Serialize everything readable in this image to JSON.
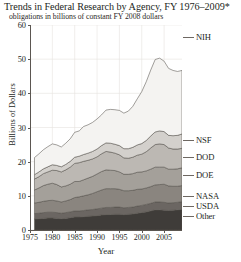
{
  "chart_data": {
    "type": "area",
    "title": "Trends in Federal Research by Agency, FY 1976–2009*",
    "subtitle": "obligations in billions of constant FY 2008 dollars",
    "xlabel": "Year",
    "ylabel": "Billions of Dollars",
    "xlim": [
      1975,
      2009
    ],
    "ylim": [
      0,
      60
    ],
    "yticks": [
      0,
      10,
      20,
      30,
      40,
      50,
      60
    ],
    "xticks": [
      1975,
      1980,
      1985,
      1990,
      1995,
      2000,
      2005
    ],
    "grid": true,
    "stacked": true,
    "legend_position": "right-inline",
    "x": [
      1976,
      1977,
      1978,
      1979,
      1980,
      1981,
      1982,
      1983,
      1984,
      1985,
      1986,
      1987,
      1988,
      1989,
      1990,
      1991,
      1992,
      1993,
      1994,
      1995,
      1996,
      1997,
      1998,
      1999,
      2000,
      2001,
      2002,
      2003,
      2004,
      2005,
      2006,
      2007,
      2008,
      2009
    ],
    "series": [
      {
        "name": "Other",
        "color": "#3f3c39",
        "values": [
          3.2,
          3.3,
          3.4,
          3.5,
          3.5,
          3.4,
          3.3,
          3.4,
          3.6,
          3.8,
          3.8,
          3.9,
          4.0,
          4.1,
          4.2,
          4.4,
          4.5,
          4.5,
          4.6,
          4.6,
          4.5,
          4.6,
          4.7,
          4.9,
          5.1,
          5.3,
          5.6,
          5.9,
          5.9,
          5.8,
          5.7,
          5.8,
          5.9,
          6.0
        ]
      },
      {
        "name": "USDA",
        "color": "#6b6662",
        "values": [
          1.6,
          1.6,
          1.7,
          1.7,
          1.7,
          1.7,
          1.6,
          1.7,
          1.7,
          1.8,
          1.8,
          1.8,
          1.9,
          1.9,
          2.0,
          2.0,
          2.1,
          2.1,
          2.1,
          2.1,
          2.0,
          2.0,
          2.0,
          2.1,
          2.1,
          2.2,
          2.2,
          2.3,
          2.3,
          2.3,
          2.2,
          2.2,
          2.2,
          2.3
        ]
      },
      {
        "name": "NASA",
        "color": "#8a857f",
        "values": [
          3.1,
          3.2,
          3.3,
          3.4,
          3.5,
          3.4,
          3.3,
          3.4,
          3.6,
          3.9,
          4.1,
          4.3,
          4.4,
          4.7,
          5.0,
          5.3,
          5.5,
          5.5,
          5.4,
          5.2,
          5.0,
          4.9,
          4.9,
          4.9,
          4.8,
          4.8,
          4.9,
          5.0,
          5.1,
          5.3,
          5.0,
          4.8,
          4.7,
          4.7
        ]
      },
      {
        "name": "DOE",
        "color": "#a4a09a",
        "values": [
          3.8,
          4.2,
          4.6,
          4.8,
          5.0,
          4.8,
          4.4,
          4.4,
          4.5,
          4.7,
          4.5,
          4.7,
          4.9,
          5.0,
          5.2,
          5.4,
          5.5,
          5.4,
          5.3,
          5.1,
          4.8,
          4.8,
          4.9,
          5.0,
          5.0,
          5.0,
          5.1,
          5.2,
          5.1,
          5.0,
          4.9,
          5.0,
          5.1,
          5.2
        ]
      },
      {
        "name": "DOD",
        "color": "#bcb8b3",
        "values": [
          3.2,
          3.3,
          3.5,
          3.6,
          3.8,
          4.1,
          4.4,
          4.7,
          5.0,
          5.3,
          5.5,
          5.4,
          5.2,
          5.1,
          5.0,
          5.2,
          5.4,
          5.3,
          5.1,
          5.0,
          4.8,
          4.7,
          4.8,
          5.0,
          5.2,
          5.6,
          6.2,
          6.6,
          6.8,
          6.6,
          6.2,
          5.9,
          5.8,
          5.7
        ]
      },
      {
        "name": "NSF",
        "color": "#d3d0cc",
        "values": [
          1.3,
          1.4,
          1.4,
          1.5,
          1.6,
          1.5,
          1.5,
          1.6,
          1.7,
          1.8,
          1.9,
          2.0,
          2.1,
          2.2,
          2.3,
          2.4,
          2.5,
          2.6,
          2.6,
          2.7,
          2.7,
          2.8,
          2.9,
          3.0,
          3.1,
          3.3,
          3.5,
          3.7,
          3.8,
          3.8,
          3.7,
          3.9,
          4.0,
          4.2
        ]
      },
      {
        "name": "NIH",
        "color": "#f4f3f1",
        "values": [
          5.0,
          5.3,
          5.6,
          5.9,
          6.1,
          6.0,
          5.8,
          6.2,
          6.6,
          7.3,
          7.4,
          8.2,
          8.3,
          8.5,
          8.8,
          9.0,
          9.6,
          9.9,
          10.1,
          10.3,
          10.4,
          11.0,
          12.0,
          13.5,
          15.2,
          17.2,
          19.3,
          21.2,
          21.3,
          20.6,
          19.6,
          19.1,
          18.7,
          18.6
        ]
      }
    ],
    "series_labels": [
      {
        "name": "NIH",
        "y": 37
      },
      {
        "name": "NSF",
        "y": 140
      },
      {
        "name": "DOD",
        "y": 157
      },
      {
        "name": "DOE",
        "y": 175
      },
      {
        "name": "NASA",
        "y": 196
      },
      {
        "name": "USDA",
        "y": 206
      },
      {
        "name": "Other",
        "y": 216
      }
    ]
  }
}
